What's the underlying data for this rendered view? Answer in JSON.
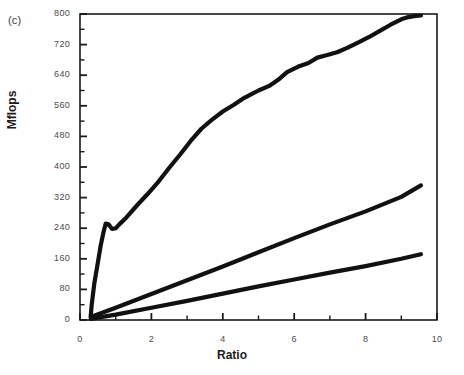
{
  "figure": {
    "panel_label": "(c)",
    "ylabel": "Mflops",
    "xlabel": "Ratio"
  },
  "chart_data": {
    "type": "line",
    "title": "",
    "subtitle": "",
    "panel": "(c)",
    "xlabel": "Ratio",
    "ylabel": "Mflops",
    "xlim": [
      0,
      10
    ],
    "ylim": [
      0,
      800
    ],
    "xticks": [
      0,
      2,
      4,
      6,
      8,
      10
    ],
    "xtick_labels": [
      "0",
      "2",
      "4",
      "6",
      "8",
      "10"
    ],
    "xminor_step": 1,
    "yticks": [
      0,
      80,
      160,
      240,
      320,
      400,
      480,
      560,
      640,
      720,
      800
    ],
    "ytick_labels": [
      "0",
      "80",
      "160",
      "240",
      "320",
      "400",
      "480",
      "560",
      "640",
      "720",
      "800"
    ],
    "yminor_step": 40,
    "grid": false,
    "legend": false,
    "legend_position": "none",
    "line_color": "#111111",
    "frame_color": "#1a1a1a",
    "series": [
      {
        "name": "top-curve",
        "line_width": 4.2,
        "x": [
          0.3,
          0.33,
          0.4,
          0.5,
          0.58,
          0.66,
          0.72,
          0.8,
          0.9,
          1.0,
          1.1,
          1.3,
          1.6,
          1.9,
          2.2,
          2.5,
          2.8,
          3.1,
          3.4,
          3.7,
          4.0,
          4.3,
          4.55,
          4.75,
          5.0,
          5.3,
          5.55,
          5.8,
          6.1,
          6.4,
          6.65,
          6.9,
          7.2,
          7.5,
          7.8,
          8.1,
          8.4,
          8.7,
          9.0,
          9.2,
          9.4,
          9.55
        ],
        "y": [
          10,
          42,
          95,
          150,
          195,
          230,
          252,
          250,
          238,
          240,
          250,
          268,
          300,
          330,
          362,
          398,
          432,
          468,
          500,
          524,
          545,
          562,
          578,
          588,
          600,
          612,
          628,
          648,
          662,
          672,
          686,
          692,
          700,
          712,
          726,
          740,
          756,
          772,
          786,
          792,
          795,
          796
        ]
      },
      {
        "name": "middle-line",
        "line_width": 4.2,
        "x": [
          0.3,
          1.0,
          2.0,
          3.0,
          4.0,
          5.0,
          6.0,
          7.0,
          8.0,
          9.0,
          9.55
        ],
        "y": [
          8,
          32,
          68,
          104,
          140,
          177,
          214,
          250,
          284,
          322,
          352
        ]
      },
      {
        "name": "bottom-line",
        "line_width": 4.2,
        "x": [
          0.3,
          1.0,
          2.0,
          3.0,
          4.0,
          5.0,
          6.0,
          7.0,
          8.0,
          9.0,
          9.55
        ],
        "y": [
          3,
          14,
          32,
          50,
          69,
          88,
          106,
          124,
          141,
          160,
          172
        ]
      }
    ]
  }
}
